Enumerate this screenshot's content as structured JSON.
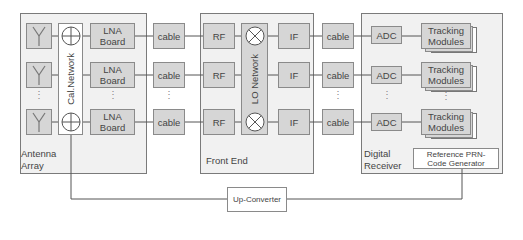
{
  "groups": {
    "antenna_array": "Antenna Array",
    "front_end": "Front End",
    "digital_receiver": "Digital Receiver"
  },
  "blocks": {
    "cal_network": "Cal.Network",
    "lna_board": "LNA Board",
    "cable": "cable",
    "rf": "RF",
    "lo_network": "LO Network",
    "if": "IF",
    "adc": "ADC",
    "tracking_modules": "Tracking Modules",
    "reference_prn": "Reference PRN-Code Generator",
    "up_converter": "Up-Converter"
  },
  "ellipsis": "⋮",
  "icons": {
    "antenna": "antenna-icon",
    "coupler": "cal-coupler-icon",
    "mixer": "mixer-icon"
  },
  "colors": {
    "block_fill": "#d6d6d6",
    "group_fill": "#f1f1f1",
    "border": "#8a8a8a",
    "line": "#555555"
  }
}
